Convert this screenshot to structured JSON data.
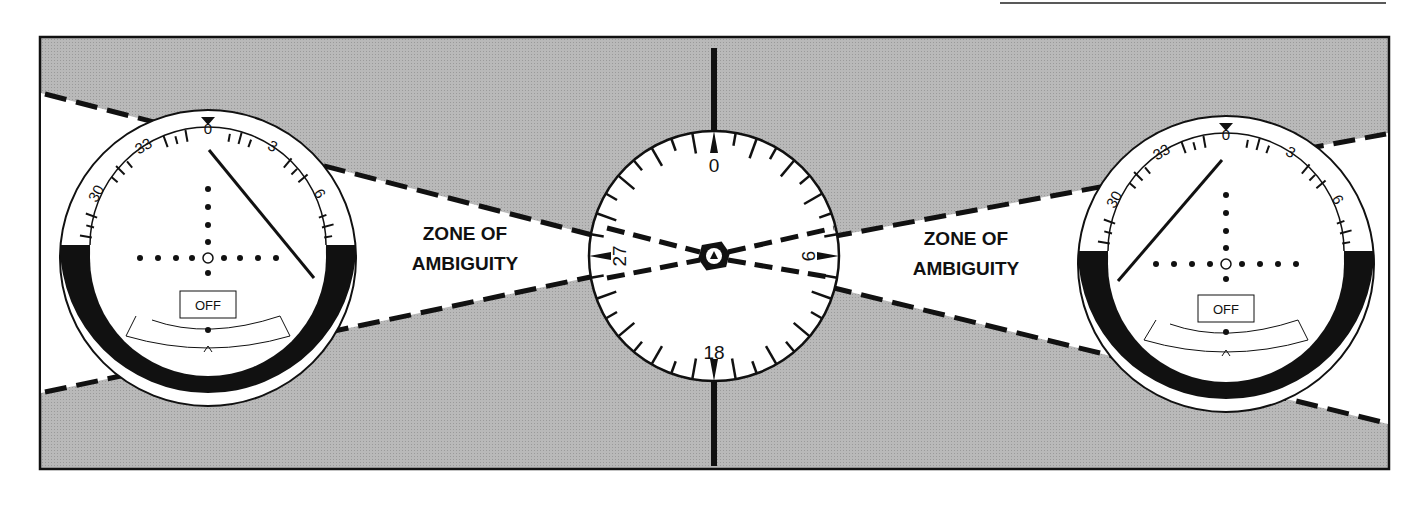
{
  "figure": {
    "colors": {
      "background_gray": "#b4b4b4",
      "zone_white": "#ffffff",
      "ink": "#111111"
    },
    "zone_labels": [
      {
        "line1": "ZONE OF",
        "line2": "AMBIGUITY"
      },
      {
        "line1": "ZONE OF",
        "line2": "AMBIGUITY"
      }
    ],
    "left_indicator": {
      "scale_labels": [
        "30",
        "33",
        "0",
        "3",
        "6"
      ],
      "flag": "OFF",
      "needle_direction": "right"
    },
    "center_compass": {
      "cardinal_labels": {
        "north": "0",
        "east": "9",
        "south": "18",
        "west": "27"
      }
    },
    "right_indicator": {
      "scale_labels": [
        "30",
        "33",
        "0",
        "3",
        "6"
      ],
      "flag": "OFF",
      "needle_direction": "left"
    }
  }
}
